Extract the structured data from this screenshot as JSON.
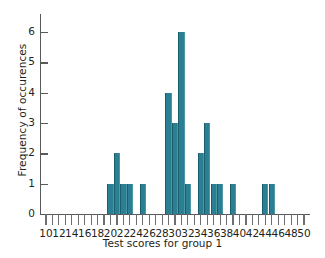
{
  "chart_data": {
    "type": "bar",
    "title": "",
    "xlabel": "Test scores for group 1",
    "ylabel": "Frequency of occurences",
    "xlim": [
      10,
      50
    ],
    "ylim": [
      0,
      6.6
    ],
    "grid": false,
    "legend": null,
    "bar_color": "#2b7f92",
    "axis_color": "#58595b",
    "x_tick_step": 1,
    "x_label_step": 2,
    "y_ticks": [
      0,
      1,
      2,
      3,
      4,
      5,
      6
    ],
    "y_tick_labels": [
      "0",
      "1",
      "2",
      "3",
      "4",
      "5",
      "6"
    ],
    "x_ticks": [
      10,
      11,
      12,
      13,
      14,
      15,
      16,
      17,
      18,
      19,
      20,
      21,
      22,
      23,
      24,
      25,
      26,
      27,
      28,
      29,
      30,
      31,
      32,
      33,
      34,
      35,
      36,
      37,
      38,
      39,
      40,
      41,
      42,
      43,
      44,
      45,
      46,
      47,
      48,
      49,
      50
    ],
    "x_tick_labels": [
      "10",
      "",
      "12",
      "",
      "14",
      "",
      "16",
      "",
      "18",
      "",
      "20",
      "",
      "22",
      "",
      "24",
      "",
      "26",
      "",
      "28",
      "",
      "30",
      "",
      "32",
      "",
      "34",
      "",
      "36",
      "",
      "38",
      "",
      "40",
      "",
      "42",
      "",
      "44",
      "",
      "46",
      "",
      "48",
      "",
      "50"
    ],
    "categories": [
      10,
      11,
      12,
      13,
      14,
      15,
      16,
      17,
      18,
      19,
      20,
      21,
      22,
      23,
      24,
      25,
      26,
      27,
      28,
      29,
      30,
      31,
      32,
      33,
      34,
      35,
      36,
      37,
      38,
      39,
      40,
      41,
      42,
      43,
      44,
      45,
      46,
      47,
      48,
      49,
      50
    ],
    "values": [
      0,
      0,
      0,
      0,
      0,
      0,
      0,
      0,
      0,
      0,
      1,
      2,
      1,
      1,
      0,
      1,
      0,
      0,
      0,
      4,
      3,
      6,
      1,
      0,
      2,
      3,
      1,
      1,
      0,
      1,
      0,
      0,
      0,
      0,
      1,
      1,
      0,
      0,
      0,
      0,
      0
    ]
  }
}
